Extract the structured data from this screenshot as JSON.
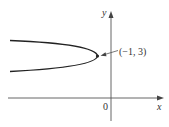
{
  "figure": {
    "type": "parabola-graph",
    "axes": {
      "x_label": "x",
      "y_label": "y",
      "origin_label": "0"
    },
    "curve": {
      "description": "parabola opening to the left",
      "vertex": [
        -1,
        3
      ],
      "vertex_label": "(−1, 3)"
    },
    "colors": {
      "axis": "#555555",
      "curve": "#222222",
      "text": "#333333"
    }
  }
}
